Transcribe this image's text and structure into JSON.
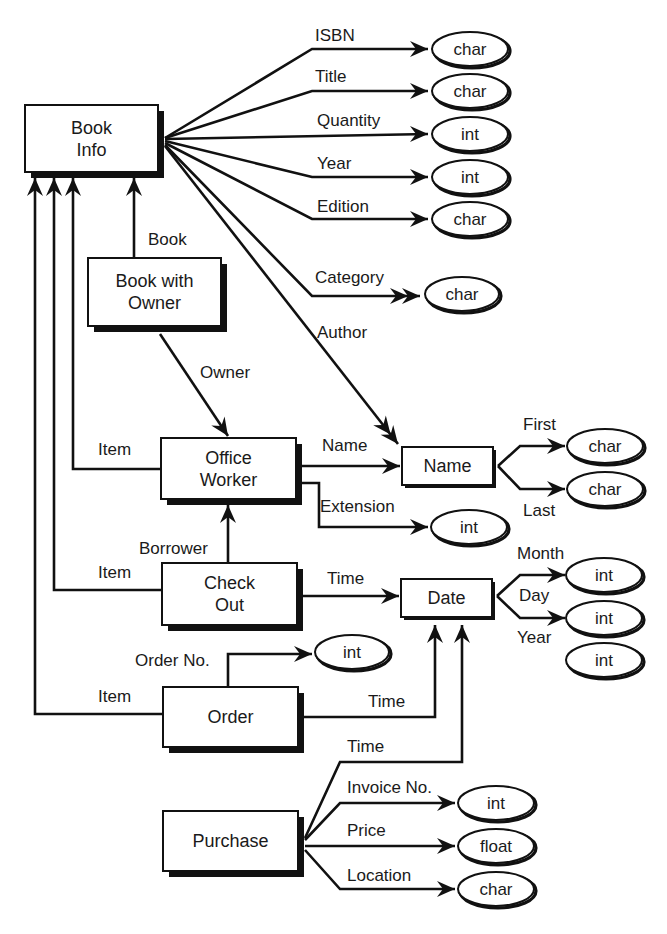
{
  "diagram": {
    "entities": [
      {
        "id": "book_info",
        "lines": [
          "Book",
          "Info"
        ],
        "x": 25,
        "y": 105,
        "w": 133,
        "h": 67,
        "shadow": 6
      },
      {
        "id": "book_with_owner",
        "lines": [
          "Book with",
          "Owner"
        ],
        "x": 88,
        "y": 258,
        "w": 133,
        "h": 68,
        "shadow": 6
      },
      {
        "id": "office_worker",
        "lines": [
          "Office",
          "Worker"
        ],
        "x": 161,
        "y": 438,
        "w": 135,
        "h": 61,
        "shadow": 6
      },
      {
        "id": "name",
        "lines": [
          "Name"
        ],
        "x": 402,
        "y": 447,
        "w": 91,
        "h": 38,
        "shadow": 3
      },
      {
        "id": "check_out",
        "lines": [
          "Check",
          "Out"
        ],
        "x": 162,
        "y": 563,
        "w": 135,
        "h": 62,
        "shadow": 6
      },
      {
        "id": "date",
        "lines": [
          "Date"
        ],
        "x": 401,
        "y": 579,
        "w": 91,
        "h": 38,
        "shadow": 3
      },
      {
        "id": "order",
        "lines": [
          "Order"
        ],
        "x": 163,
        "y": 687,
        "w": 135,
        "h": 60,
        "shadow": 6
      },
      {
        "id": "purchase",
        "lines": [
          "Purchase"
        ],
        "x": 163,
        "y": 811,
        "w": 135,
        "h": 60,
        "shadow": 6
      }
    ],
    "types": [
      {
        "id": "isbn_type",
        "label": "char",
        "cx": 470,
        "cy": 49,
        "rx": 38,
        "ry": 17
      },
      {
        "id": "title_type",
        "label": "char",
        "cx": 470,
        "cy": 91,
        "rx": 38,
        "ry": 17
      },
      {
        "id": "quantity_type",
        "label": "int",
        "cx": 470,
        "cy": 134,
        "rx": 38,
        "ry": 17
      },
      {
        "id": "year_type",
        "label": "int",
        "cx": 470,
        "cy": 177,
        "rx": 38,
        "ry": 17
      },
      {
        "id": "edition_type",
        "label": "char",
        "cx": 470,
        "cy": 219,
        "rx": 38,
        "ry": 17
      },
      {
        "id": "category_type",
        "label": "char",
        "cx": 462,
        "cy": 294,
        "rx": 37,
        "ry": 17
      },
      {
        "id": "first_type",
        "label": "char",
        "cx": 605,
        "cy": 446,
        "rx": 38,
        "ry": 17
      },
      {
        "id": "last_type",
        "label": "char",
        "cx": 605,
        "cy": 489,
        "rx": 38,
        "ry": 17
      },
      {
        "id": "extension_type",
        "label": "int",
        "cx": 469,
        "cy": 527,
        "rx": 38,
        "ry": 17
      },
      {
        "id": "month_type",
        "label": "int",
        "cx": 604,
        "cy": 575,
        "rx": 38,
        "ry": 17
      },
      {
        "id": "day_type",
        "label": "int",
        "cx": 604,
        "cy": 618,
        "rx": 38,
        "ry": 17
      },
      {
        "id": "year2_type",
        "label": "int",
        "cx": 604,
        "cy": 660,
        "rx": 38,
        "ry": 17
      },
      {
        "id": "order_no_type",
        "label": "int",
        "cx": 352,
        "cy": 652,
        "rx": 37,
        "ry": 17
      },
      {
        "id": "invoice_no_type",
        "label": "int",
        "cx": 496,
        "cy": 803,
        "rx": 38,
        "ry": 17
      },
      {
        "id": "price_type",
        "label": "float",
        "cx": 496,
        "cy": 846,
        "rx": 38,
        "ry": 17
      },
      {
        "id": "location_type",
        "label": "char",
        "cx": 496,
        "cy": 889,
        "rx": 38,
        "ry": 17
      }
    ],
    "relations": [
      {
        "id": "isbn",
        "label": "ISBN",
        "lx": 315,
        "ly": 41,
        "path": "M165 138 L312 49 L428 49",
        "arrow": [
          428,
          49,
          0
        ]
      },
      {
        "id": "title",
        "label": "Title",
        "lx": 315,
        "ly": 82,
        "path": "M165 138 L312 91 L428 91",
        "arrow": [
          428,
          91,
          0
        ]
      },
      {
        "id": "quantity",
        "label": "Quantity",
        "lx": 317,
        "ly": 126,
        "path": "M165 139 L428 134",
        "arrow": [
          428,
          134,
          0
        ]
      },
      {
        "id": "year",
        "label": "Year",
        "lx": 317,
        "ly": 169,
        "path": "M165 141 L312 177 L428 177",
        "arrow": [
          428,
          177,
          0
        ]
      },
      {
        "id": "edition",
        "label": "Edition",
        "lx": 317,
        "ly": 212,
        "path": "M165 143 L312 219 L428 219",
        "arrow": [
          428,
          219,
          0
        ]
      },
      {
        "id": "category",
        "label": "Category",
        "lx": 315,
        "ly": 283,
        "path": "M165 145 L312 296 L420 296",
        "arrow": [
          420,
          296,
          0
        ],
        "double": true
      },
      {
        "id": "author",
        "label": "Author",
        "lx": 317,
        "ly": 338,
        "path": "M165 146 L398 444",
        "arrow": [
          398,
          444,
          52
        ],
        "double": true
      },
      {
        "id": "book",
        "label": "Book",
        "lx": 148,
        "ly": 245,
        "path": "M134 258 L134 178",
        "arrow": [
          134,
          178,
          -90
        ]
      },
      {
        "id": "owner",
        "label": "Owner",
        "lx": 200,
        "ly": 378,
        "path": "M160 334 L228 436",
        "arrow": [
          228,
          436,
          56
        ]
      },
      {
        "id": "ow_item",
        "label": "Item",
        "lx": 98,
        "ly": 455,
        "path": "M161 469 L73 469 L73 178",
        "arrow": [
          73,
          178,
          -90
        ]
      },
      {
        "id": "ow_name",
        "label": "Name",
        "lx": 322,
        "ly": 451,
        "path": "M302 466 L400 466",
        "arrow": [
          400,
          466,
          0
        ]
      },
      {
        "id": "ow_extension",
        "label": "Extension",
        "lx": 320,
        "ly": 512,
        "path": "M302 483 L319 483 L319 527 L428 527",
        "arrow": [
          428,
          527,
          0
        ]
      },
      {
        "id": "first",
        "label": "First",
        "lx": 523,
        "ly": 430,
        "path": "M498 466 L520 446 L565 446",
        "arrow": [
          565,
          446,
          0
        ]
      },
      {
        "id": "last",
        "label": "Last",
        "lx": 523,
        "ly": 516,
        "path": "M498 466 L520 489 L565 489",
        "arrow": [
          565,
          489,
          0
        ]
      },
      {
        "id": "borrower",
        "label": "Borrower",
        "lx": 139,
        "ly": 554,
        "path": "M228 563 L228 505",
        "arrow": [
          228,
          505,
          -90
        ]
      },
      {
        "id": "co_item",
        "label": "Item",
        "lx": 98,
        "ly": 578,
        "path": "M162 590 L54 590 L54 178",
        "arrow": [
          54,
          178,
          -90
        ]
      },
      {
        "id": "co_time",
        "label": "Time",
        "lx": 327,
        "ly": 584,
        "path": "M303 596 L399 596",
        "arrow": [
          399,
          596,
          0
        ]
      },
      {
        "id": "month",
        "label": "Month",
        "lx": 517,
        "ly": 559,
        "path": "M497 596 L520 575 L565 575",
        "arrow": [
          565,
          575,
          0
        ]
      },
      {
        "id": "day",
        "label": "Day",
        "lx": 519,
        "ly": 601,
        "path": "M497 596 L520 618 L565 618",
        "arrow": [
          565,
          618,
          0
        ]
      },
      {
        "id": "year2",
        "label": "Year",
        "lx": 517,
        "ly": 643,
        "path": ""
      },
      {
        "id": "order_no",
        "label": "Order No.",
        "lx": 135,
        "ly": 666,
        "path": "M228 687 L228 654 L312 654",
        "arrow": [
          312,
          654,
          0
        ]
      },
      {
        "id": "or_item",
        "label": "Item",
        "lx": 98,
        "ly": 702,
        "path": "M163 714 L35 714 L35 178",
        "arrow": [
          35,
          178,
          -90
        ]
      },
      {
        "id": "or_time",
        "label": "Time",
        "lx": 368,
        "ly": 707,
        "path": "M303 717 L435 717 L435 625",
        "arrow": [
          435,
          625,
          -90
        ]
      },
      {
        "id": "pu_time",
        "label": "Time",
        "lx": 347,
        "ly": 752,
        "path": "M305 838 L340 762 L462 762 L462 625",
        "arrow": [
          462,
          625,
          -90
        ]
      },
      {
        "id": "invoice_no",
        "label": "Invoice No.",
        "lx": 347,
        "ly": 793,
        "path": "M305 840 L340 803 L455 803",
        "arrow": [
          455,
          803,
          0
        ]
      },
      {
        "id": "price",
        "label": "Price",
        "lx": 347,
        "ly": 836,
        "path": "M305 846 L455 846",
        "arrow": [
          455,
          846,
          0
        ]
      },
      {
        "id": "location",
        "label": "Location",
        "lx": 347,
        "ly": 881,
        "path": "M305 850 L340 889 L455 889",
        "arrow": [
          455,
          889,
          0
        ]
      }
    ]
  }
}
